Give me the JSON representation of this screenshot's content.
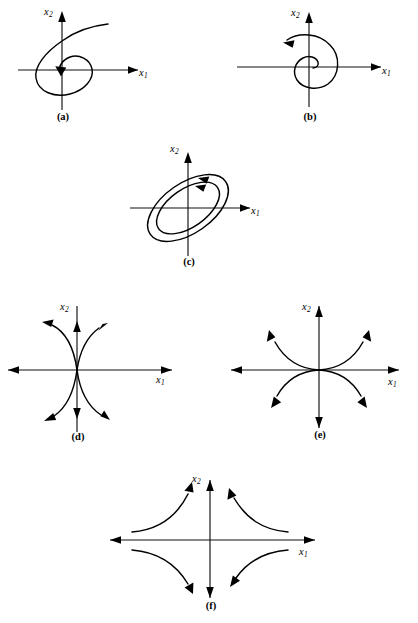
{
  "figure": {
    "background_color": "#ffffff",
    "stroke_color": "#000000",
    "axis_color": "#111111"
  },
  "chart_data": {
    "type": "line",
    "xlabel": "x1",
    "ylabel": "x2",
    "grid": false,
    "legend": null,
    "panels": [
      {
        "key": "a",
        "caption": "(a)",
        "x_axis_label": "x1",
        "y_axis_label": "x2",
        "description": "Stable focus: trajectory spirals inward clockwise toward the origin",
        "equilibrium_type": "stable focus (spiral sink)",
        "arrow_count": 3,
        "trajectory_count": 1,
        "spiral_direction": "clockwise",
        "flow_direction": "inward"
      },
      {
        "key": "b",
        "caption": "(b)",
        "x_axis_label": "x1",
        "y_axis_label": "x2",
        "description": "Unstable focus: trajectory spirals outward counterclockwise from the origin",
        "equilibrium_type": "unstable focus (spiral source)",
        "arrow_count": 3,
        "trajectory_count": 1,
        "spiral_direction": "counterclockwise",
        "flow_direction": "outward"
      },
      {
        "key": "c",
        "caption": "(c)",
        "x_axis_label": "x1",
        "y_axis_label": "x2",
        "description": "Center: two concentric tilted closed elliptical orbits around the origin",
        "equilibrium_type": "center (periodic orbits)",
        "arrow_count": 4,
        "trajectory_count": 2,
        "spiral_direction": "counterclockwise",
        "flow_direction": "closed orbits"
      },
      {
        "key": "d",
        "caption": "(d)",
        "x_axis_label": "x1",
        "y_axis_label": "x2",
        "description": "Saddle point: trajectories approach along the vertical axis and depart along the horizontal axis",
        "equilibrium_type": "saddle point",
        "arrow_count": 8,
        "trajectory_count": 4,
        "flow_direction": "in along x2, out along x1"
      },
      {
        "key": "e",
        "caption": "(e)",
        "x_axis_label": "x1",
        "y_axis_label": "x2",
        "description": "Unstable node: all trajectories flow outward away from the origin",
        "equilibrium_type": "unstable node (source)",
        "arrow_count": 8,
        "trajectory_count": 4,
        "flow_direction": "outward"
      },
      {
        "key": "f",
        "caption": "(f)",
        "x_axis_label": "x1",
        "y_axis_label": "x2",
        "description": "Saddle point: hyperbolic trajectories approach along the horizontal axis and depart along the vertical axis",
        "equilibrium_type": "saddle point",
        "arrow_count": 8,
        "trajectory_count": 4,
        "flow_direction": "in along x1, out along x2"
      }
    ]
  }
}
